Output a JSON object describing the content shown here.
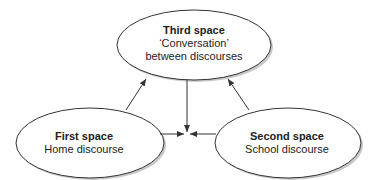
{
  "diagram": {
    "nodes": [
      {
        "id": "third",
        "title": "Third space",
        "lines": [
          "‘Conversation’",
          "between discourses"
        ]
      },
      {
        "id": "first",
        "title": "First space",
        "lines": [
          "Home discourse"
        ]
      },
      {
        "id": "second",
        "title": "Second space",
        "lines": [
          "School discourse"
        ]
      }
    ],
    "edges": [
      {
        "from": "first",
        "to": "third"
      },
      {
        "from": "second",
        "to": "third"
      },
      {
        "from": "third",
        "to": "center"
      },
      {
        "from": "first",
        "to": "center"
      },
      {
        "from": "second",
        "to": "center"
      }
    ],
    "colors": {
      "stroke": "#333333",
      "fill": "#ffffff",
      "shadow": "#bdbdbd",
      "text": "#222222"
    }
  }
}
